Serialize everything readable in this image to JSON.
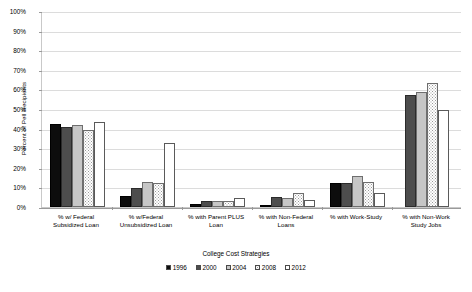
{
  "chart_data": {
    "type": "bar",
    "title": "",
    "xlabel": "College Cost Strategies",
    "ylabel": "Percent of Pell Recipients",
    "ylim": [
      0,
      100
    ],
    "ytick_labels": [
      "0%",
      "10%",
      "20%",
      "30%",
      "40%",
      "50%",
      "60%",
      "70%",
      "80%",
      "90%",
      "100%"
    ],
    "ytick_values": [
      0,
      10,
      20,
      30,
      40,
      50,
      60,
      70,
      80,
      90,
      100
    ],
    "grid": true,
    "legend_position": "bottom",
    "categories": [
      "% w/ Federal Subsidized Loan",
      "% w/Federal Unsubsidized Loan",
      "% with Parent PLUS Loan",
      "% with Non-Federal Loans",
      "% with Work-Study",
      "% with Non-Work Study Jobs"
    ],
    "category_lines": [
      [
        "% w/ Federal",
        "Subsidized Loan"
      ],
      [
        "% w/Federal",
        "Unsubsidized Loan"
      ],
      [
        "% with Parent PLUS",
        "Loan"
      ],
      [
        "% with Non-Federal",
        "Loans"
      ],
      [
        "% with Work-Study",
        ""
      ],
      [
        "% with Non-Work",
        "Study Jobs"
      ]
    ],
    "series": [
      {
        "name": "1996",
        "color": "#0d0d0d",
        "values": [
          42.5,
          5.5,
          1.5,
          1.0,
          12.5,
          null
        ]
      },
      {
        "name": "2000",
        "color": "#4d4d4d",
        "values": [
          41.0,
          9.5,
          3.0,
          5.0,
          12.0,
          57.0
        ]
      },
      {
        "name": "2004",
        "color": "#c6c6c6",
        "values": [
          42.0,
          13.0,
          3.0,
          4.5,
          16.0,
          58.5
        ]
      },
      {
        "name": "2008",
        "color": "#ffffff",
        "values": [
          39.5,
          12.0,
          3.0,
          7.0,
          13.0,
          63.5
        ]
      },
      {
        "name": "2012",
        "color": "#ffffff",
        "values": [
          43.5,
          32.5,
          4.5,
          3.5,
          7.0,
          49.5
        ]
      }
    ]
  },
  "legend": {
    "items": [
      {
        "label": "1996"
      },
      {
        "label": "2000"
      },
      {
        "label": "2004"
      },
      {
        "label": "2008"
      },
      {
        "label": "2012"
      }
    ]
  },
  "caption": {
    "text": ""
  }
}
